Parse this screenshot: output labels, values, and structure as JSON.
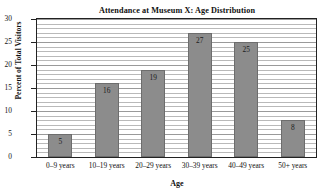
{
  "chart_data": {
    "type": "bar",
    "title": "Attendance at Museum X: Age Distribution",
    "xlabel": "Age",
    "ylabel": "Percent of Total Visitors",
    "categories": [
      "0–9 years",
      "10–19 years",
      "20–29 years",
      "30–39 years",
      "40–49 years",
      "50+ years"
    ],
    "values": [
      5,
      16,
      19,
      27,
      25,
      8
    ],
    "data_labels": [
      "5",
      "16",
      "19",
      "27",
      "25",
      "8"
    ],
    "ylim": [
      0,
      30
    ],
    "yticks": [
      0,
      5,
      10,
      15,
      20,
      25,
      30
    ],
    "ytick_labels": [
      "0",
      "5",
      "10",
      "15",
      "20",
      "25",
      "30"
    ],
    "grid": "horizontal",
    "grid_step": 1,
    "legend": "none",
    "bar_color": "#8c8c8c",
    "bar_edge_color": "#6d6d6d",
    "grid_color": "#b9b9b9",
    "axis_color": "#222222",
    "background": "#ffffff"
  }
}
